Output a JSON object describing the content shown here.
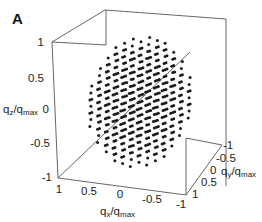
{
  "chart_data": {
    "type": "scatter3d",
    "panel_label": "A",
    "title": "",
    "xlabel": "q_x/q_max",
    "ylabel": "q_y/q_max",
    "zlabel": "q_z/q_max",
    "xlim": [
      -1,
      1
    ],
    "ylim": [
      -1,
      1
    ],
    "zlim": [
      -1,
      1
    ],
    "x_ticks": [
      "1",
      "0.5",
      "0",
      "-0.5",
      "-1"
    ],
    "y_ticks": [
      "-1",
      "-0.5",
      "0",
      "0.5",
      "1"
    ],
    "z_ticks": [
      "1",
      "0.5",
      "0",
      "-0.5",
      "-1"
    ],
    "grid": false,
    "box": true,
    "points": "cubic lattice points with |q| <= ~0.9 q_max (roughly 11 points across each diameter)",
    "marker_color": "#1a1a1a"
  },
  "labels": {
    "panel": "A",
    "x_axis": "q",
    "x_sub": "x",
    "x_den": "/q",
    "x_den_sub": "max",
    "y_axis": "q",
    "y_sub": "y",
    "y_den": "/q",
    "y_den_sub": "max",
    "z_axis": "q",
    "z_sub": "z",
    "z_den": "/q",
    "z_den_sub": "max"
  }
}
